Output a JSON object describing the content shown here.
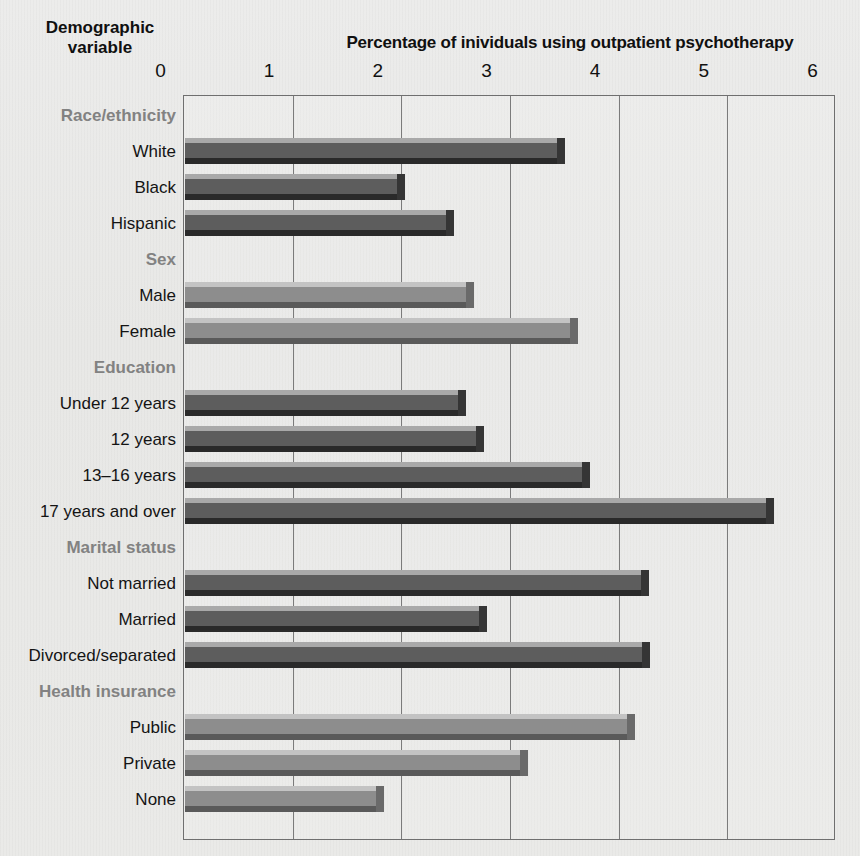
{
  "header": {
    "demographic_title_line1": "Demographic",
    "demographic_title_line2": "variable",
    "axis_title": "Percentage of inividuals using outpatient psychotherapy"
  },
  "chart_data": {
    "type": "bar",
    "orientation": "horizontal",
    "title": "Percentage of inividuals using outpatient psychotherapy",
    "xlabel": "Percentage of inividuals using outpatient psychotherapy",
    "ylabel": "Demographic variable",
    "xlim": [
      0,
      6
    ],
    "xticks": [
      "0",
      "1",
      "2",
      "3",
      "4",
      "5",
      "6"
    ],
    "grid": true,
    "legend": "none",
    "groups": [
      {
        "name": "Race/ethnicity",
        "style": "dark",
        "items": [
          {
            "label": "White",
            "value": 3.5
          },
          {
            "label": "Black",
            "value": 2.02
          },
          {
            "label": "Hispanic",
            "value": 2.48
          }
        ]
      },
      {
        "name": "Sex",
        "style": "light",
        "items": [
          {
            "label": "Male",
            "value": 2.66
          },
          {
            "label": "Female",
            "value": 3.62
          }
        ]
      },
      {
        "name": "Education",
        "style": "dark",
        "items": [
          {
            "label": "Under 12 years",
            "value": 2.59
          },
          {
            "label": "12 years",
            "value": 2.75
          },
          {
            "label": "13–16 years",
            "value": 3.73
          },
          {
            "label": "17 years and over",
            "value": 5.42
          }
        ]
      },
      {
        "name": "Marital status",
        "style": "dark",
        "items": [
          {
            "label": "Not married",
            "value": 4.27
          },
          {
            "label": "Married",
            "value": 2.78
          },
          {
            "label": "Divorced/separated",
            "value": 4.28
          }
        ]
      },
      {
        "name": "Health insurance",
        "style": "light",
        "items": [
          {
            "label": "Public",
            "value": 4.14
          },
          {
            "label": "Private",
            "value": 3.16
          },
          {
            "label": "None",
            "value": 1.83
          }
        ]
      }
    ],
    "colors": {
      "dark_bar_face": "#5d5d5d",
      "dark_bar_top": "#a9a9a9",
      "dark_bar_bottom": "#2a2a2a",
      "light_bar_face": "#8d8d8d",
      "light_bar_top": "#c3c3c3",
      "light_bar_bottom": "#5a5a5a",
      "background": "#e9e9e7",
      "frame": "#6f6f6f",
      "group_label": "#828282",
      "item_label": "#141414"
    }
  }
}
